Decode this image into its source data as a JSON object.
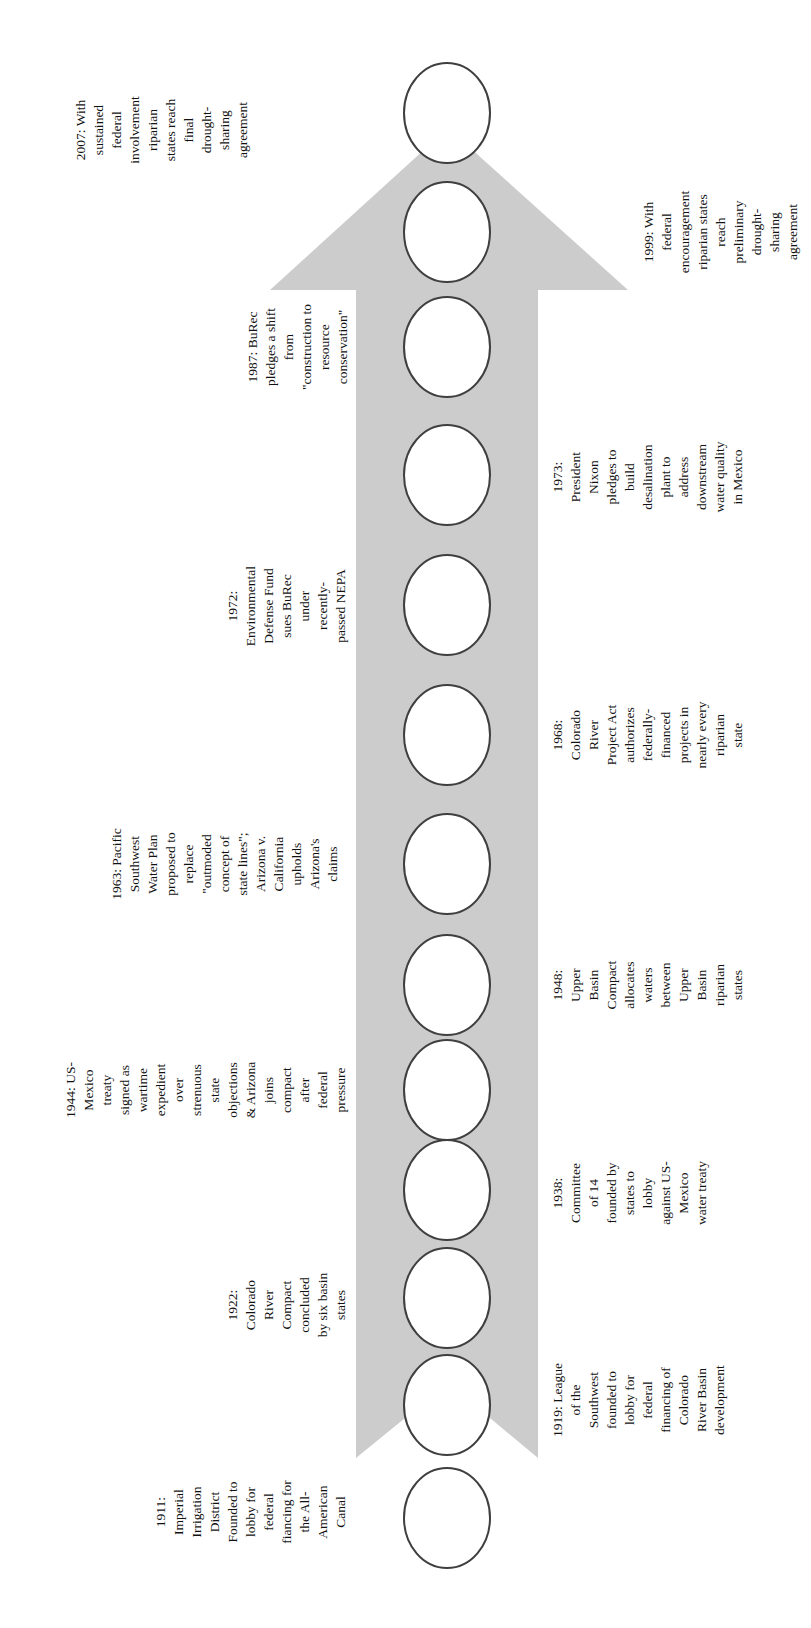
{
  "page": {
    "width": 811,
    "height": 1628,
    "background": "#ffffff"
  },
  "timeline": {
    "type": "vertical-arrow-timeline",
    "arrow": {
      "direction": "up",
      "fill": "#cccccc"
    },
    "node": {
      "fill": "#ffffff",
      "stroke": "#3f3f3f",
      "count": 13
    },
    "text_color": "#111111",
    "events": [
      {
        "year": "2007",
        "side": "left",
        "text": "2007: With\nsustained\nfederal\ninvolvement\nriparian\nstates reach\nfinal\ndrought-\nsharing\nagreement"
      },
      {
        "year": "1999",
        "side": "right",
        "text": "1999: With\nfederal\nencouragement\nriparian states\nreach\npreliminary\ndrought-\nsharing\nagreement"
      },
      {
        "year": "1987",
        "side": "left",
        "text": "1987: BuRec\npledges a shift\nfrom\n\"construction to\nresource\nconservation\""
      },
      {
        "year": "1973",
        "side": "right",
        "text": "1973:\nPresident\nNixon\npledges to\nbuild\ndesalination\nplant to\naddress\ndownstream\nwater quality\nin Mexico"
      },
      {
        "year": "1972",
        "side": "left",
        "text": "1972:\nEnvironmental\nDefense Fund\nsues BuRec\nunder\nrecently-\npassed NEPA"
      },
      {
        "year": "1968",
        "side": "right",
        "text": "1968:\nColorado\nRiver\nProject Act\nauthorizes\nfederally-\nfinanced\nprojects in\nnearly every\nriparian\nstate"
      },
      {
        "year": "1963",
        "side": "left",
        "text": "1963: Pacific\nSouthwest\nWater Plan\nproposed to\nreplace\n\"outmoded\nconcept of\nstate lines\";\nArizona v.\nCalifornia\nupholds\nArizona's\nclaims"
      },
      {
        "year": "1948",
        "side": "right",
        "text": "1948:\nUpper\nBasin\nCompact\nallocates\nwaters\nbetween\nUpper\nBasin\nriparian\nstates"
      },
      {
        "year": "1944",
        "side": "left",
        "text": "1944: US-\nMexico\ntreaty\nsigned as\nwartime\nexpedient\nover\nstrenuous\nstate\nobjections\n& Arizona\njoins\ncompact\nafter\nfederal\npressure"
      },
      {
        "year": "1938",
        "side": "right",
        "text": "1938:\nCommittee\nof 14\nfounded by\nstates to\nlobby\nagainst US-\nMexico\nwater treaty"
      },
      {
        "year": "1922",
        "side": "left",
        "text": "1922:\nColorado\nRiver\nCompact\nconcluded\nby six basin\nstates"
      },
      {
        "year": "1919",
        "side": "right",
        "text": "1919: League\nof the\nSouthwest\nfounded to\nlobby for\nfederal\nfinancing of\nColorado\nRiver Basin\ndevelopment"
      },
      {
        "year": "1911",
        "side": "left",
        "text": "1911:\nImperial\nIrrigation\nDistrict\nFounded to\nlobby for\nfederal\nfiancing for\nthe All-\nAmerican\nCanal"
      }
    ]
  }
}
